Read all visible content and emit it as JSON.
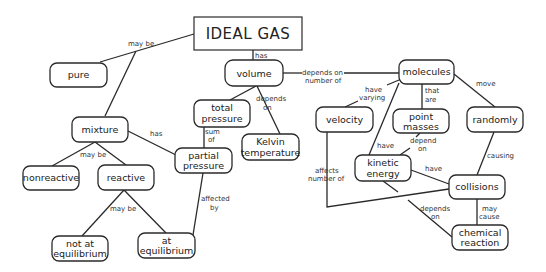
{
  "title": "IDEAL GAS",
  "nodes": {
    "ideal_gas": "IDEAL GAS",
    "pure": "pure",
    "mixture": "mixture",
    "nonreactive": "nonreactive",
    "reactive": "reactive",
    "not_at_equilibrium": [
      "not at",
      "equilibrium"
    ],
    "at_equilibrium": [
      "at",
      "equilibrium"
    ],
    "volume": "volume",
    "total_pressure": [
      "total",
      "pressure"
    ],
    "kelvin_temperature": [
      "Kelvin",
      "temperature"
    ],
    "partial_pressure": [
      "partial",
      "pressure"
    ],
    "molecules": "molecules",
    "velocity": "velocity",
    "point_masses": [
      "point",
      "masses"
    ],
    "randomly": "randomly",
    "kinetic_energy": [
      "kinetic",
      "energy"
    ],
    "collisions": "collisions",
    "chemical_reaction": [
      "chemical",
      "reaction"
    ]
  },
  "edges": {
    "may_be_top": "may be",
    "has_volume": "has",
    "mixture_has": "has",
    "mixture_may_be": "may be",
    "reactive_may_be": "may be",
    "sum_of": [
      "sum",
      "of"
    ],
    "affected_by": [
      "affected",
      "by"
    ],
    "volume_depends_on": [
      "depends",
      "on"
    ],
    "depends_on_number_of": [
      "depends on",
      "number of"
    ],
    "have_varying": [
      "have",
      "varying"
    ],
    "that_are": [
      "that",
      "are"
    ],
    "move": "move",
    "have_ke": "have",
    "depend_on": [
      "depend",
      "on"
    ],
    "causing": "causing",
    "affects_number_of": [
      "affects",
      "number of"
    ],
    "ke_have": "have",
    "depends_on_cr": [
      "depends",
      "on"
    ],
    "may_cause": [
      "may",
      "cause"
    ]
  }
}
